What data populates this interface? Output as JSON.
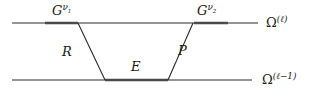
{
  "figure": {
    "background_color": "#ffffff",
    "line_color": "#2b2b2b",
    "bold_line_color": "#4a4a4a",
    "width": 314,
    "height": 100
  },
  "labels": {
    "smoother_pre": {
      "base": "G",
      "superscript": "ν",
      "sub": "1"
    },
    "smoother_post": {
      "base": "G",
      "superscript": "ν",
      "sub": "2"
    },
    "restriction": "R",
    "coarse_solve": "E",
    "prolongation": "P",
    "level_fine": {
      "base": "Ω",
      "superscript": "(ℓ)"
    },
    "level_coarse": {
      "base": "Ω",
      "superscript": "(ℓ−1)"
    }
  },
  "geometry": {
    "fine_level_y": 23,
    "coarse_level_y": 80,
    "fine_line_x_start": 12,
    "fine_line_x_end": 258,
    "coarse_line_x_start": 12,
    "coarse_line_x_end": 252,
    "trapezoid": {
      "top_left_x": 78,
      "bottom_left_x": 105,
      "bottom_right_x": 168,
      "top_right_x": 193
    },
    "bold_segments": [
      {
        "name": "pre-smoothing-segment",
        "x_start": 45,
        "x_end": 78,
        "y": 23
      },
      {
        "name": "post-smoothing-segment",
        "x_start": 194,
        "x_end": 228,
        "y": 23
      },
      {
        "name": "coarse-grid-segment",
        "x_start": 105,
        "x_end": 168,
        "y": 80
      }
    ]
  }
}
